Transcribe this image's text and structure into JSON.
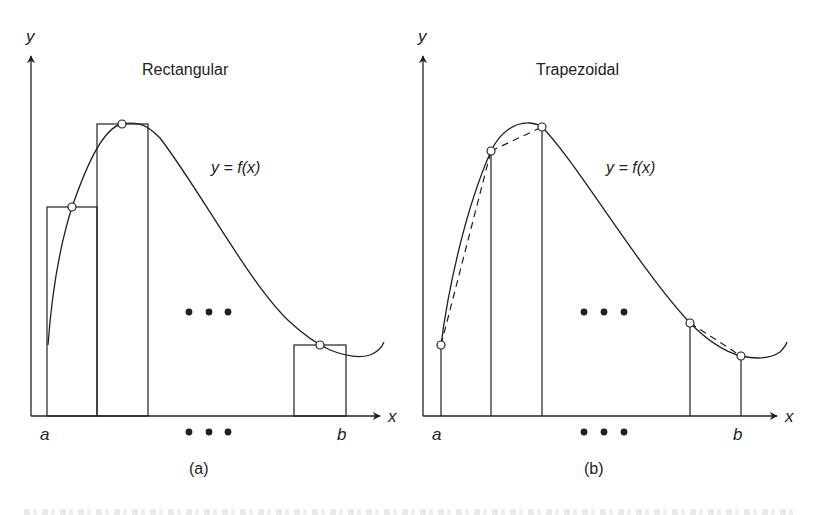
{
  "figure": {
    "panels": [
      {
        "id": "a",
        "title": "Rectangular",
        "sublabel": "(a)",
        "curve_label": "y = f(x)",
        "axis_labels": {
          "x": "x",
          "y": "y",
          "a": "a",
          "b": "b"
        },
        "ellipsis": "• • •"
      },
      {
        "id": "b",
        "title": "Trapezoidal",
        "sublabel": "(b)",
        "curve_label": "y = f(x)",
        "axis_labels": {
          "x": "x",
          "y": "y",
          "a": "a",
          "b": "b"
        },
        "ellipsis": "• • •"
      }
    ],
    "colors": {
      "line": "#231f20",
      "background": "#ffffff"
    }
  }
}
